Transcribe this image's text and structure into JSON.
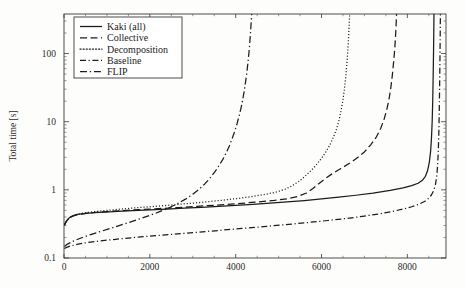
{
  "chart_data": {
    "type": "line",
    "title": "",
    "xlabel": "",
    "ylabel": "Total time [s]",
    "xlim": [
      0,
      8900
    ],
    "ylim": [
      0.1,
      380
    ],
    "yscale": "log",
    "xscale": "linear",
    "grid": false,
    "legend_position": "top-left",
    "xticks": [
      0,
      2000,
      4000,
      6000,
      8000
    ],
    "xtick_labels": [
      "0",
      "2000",
      "4000",
      "6000",
      "8000"
    ],
    "yticks": [
      0.1,
      1,
      10,
      100
    ],
    "ytick_labels": [
      "0.1",
      "1",
      "10",
      "100"
    ],
    "series": [
      {
        "name": "Kaki (all)",
        "dash": "none",
        "points": [
          [
            10,
            0.3
          ],
          [
            25,
            0.315
          ],
          [
            45,
            0.335
          ],
          [
            70,
            0.355
          ],
          [
            100,
            0.375
          ],
          [
            140,
            0.395
          ],
          [
            190,
            0.412
          ],
          [
            250,
            0.425
          ],
          [
            320,
            0.435
          ],
          [
            400,
            0.443
          ],
          [
            520,
            0.452
          ],
          [
            700,
            0.462
          ],
          [
            950,
            0.472
          ],
          [
            1250,
            0.483
          ],
          [
            1600,
            0.495
          ],
          [
            2000,
            0.508
          ],
          [
            2400,
            0.522
          ],
          [
            2800,
            0.537
          ],
          [
            3200,
            0.553
          ],
          [
            3600,
            0.57
          ],
          [
            4000,
            0.59
          ],
          [
            4400,
            0.612
          ],
          [
            4800,
            0.637
          ],
          [
            5200,
            0.665
          ],
          [
            5600,
            0.697
          ],
          [
            6000,
            0.735
          ],
          [
            6400,
            0.78
          ],
          [
            6800,
            0.833
          ],
          [
            7200,
            0.898
          ],
          [
            7600,
            0.985
          ],
          [
            7900,
            1.07
          ],
          [
            8100,
            1.15
          ],
          [
            8250,
            1.25
          ],
          [
            8350,
            1.38
          ],
          [
            8420,
            1.58
          ],
          [
            8470,
            1.9
          ],
          [
            8510,
            2.5
          ],
          [
            8540,
            3.6
          ],
          [
            8560,
            5.5
          ],
          [
            8578,
            10
          ],
          [
            8592,
            22
          ],
          [
            8602,
            50
          ],
          [
            8610,
            110
          ],
          [
            8616,
            230
          ],
          [
            8620,
            380
          ]
        ]
      },
      {
        "name": "Collective",
        "dash": "dashed",
        "points": [
          [
            10,
            0.305
          ],
          [
            30,
            0.325
          ],
          [
            60,
            0.348
          ],
          [
            100,
            0.372
          ],
          [
            150,
            0.395
          ],
          [
            220,
            0.415
          ],
          [
            300,
            0.43
          ],
          [
            400,
            0.442
          ],
          [
            550,
            0.455
          ],
          [
            750,
            0.468
          ],
          [
            1000,
            0.48
          ],
          [
            1350,
            0.495
          ],
          [
            1750,
            0.512
          ],
          [
            2200,
            0.53
          ],
          [
            2650,
            0.55
          ],
          [
            3100,
            0.572
          ],
          [
            3550,
            0.597
          ],
          [
            4000,
            0.625
          ],
          [
            4450,
            0.658
          ],
          [
            4900,
            0.7
          ],
          [
            5200,
            0.74
          ],
          [
            5450,
            0.8
          ],
          [
            5650,
            0.9
          ],
          [
            5800,
            1.05
          ],
          [
            5950,
            1.25
          ],
          [
            6100,
            1.48
          ],
          [
            6250,
            1.72
          ],
          [
            6450,
            2.05
          ],
          [
            6650,
            2.45
          ],
          [
            6850,
            3.0
          ],
          [
            7000,
            3.6
          ],
          [
            7150,
            4.6
          ],
          [
            7280,
            6.0
          ],
          [
            7380,
            8.0
          ],
          [
            7460,
            11
          ],
          [
            7520,
            15
          ],
          [
            7570,
            21
          ],
          [
            7610,
            30
          ],
          [
            7645,
            45
          ],
          [
            7675,
            70
          ],
          [
            7700,
            105
          ],
          [
            7720,
            160
          ],
          [
            7735,
            240
          ],
          [
            7748,
            380
          ]
        ]
      },
      {
        "name": "Decomposition",
        "dash": "dotted",
        "points": [
          [
            10,
            0.31
          ],
          [
            30,
            0.33
          ],
          [
            60,
            0.352
          ],
          [
            100,
            0.375
          ],
          [
            150,
            0.398
          ],
          [
            220,
            0.42
          ],
          [
            310,
            0.438
          ],
          [
            420,
            0.452
          ],
          [
            570,
            0.468
          ],
          [
            760,
            0.483
          ],
          [
            1000,
            0.5
          ],
          [
            1300,
            0.52
          ],
          [
            1650,
            0.543
          ],
          [
            2050,
            0.568
          ],
          [
            2450,
            0.595
          ],
          [
            2850,
            0.625
          ],
          [
            3250,
            0.66
          ],
          [
            3650,
            0.7
          ],
          [
            4050,
            0.748
          ],
          [
            4400,
            0.8
          ],
          [
            4700,
            0.86
          ],
          [
            4950,
            0.93
          ],
          [
            5150,
            1.02
          ],
          [
            5320,
            1.15
          ],
          [
            5470,
            1.33
          ],
          [
            5600,
            1.55
          ],
          [
            5730,
            1.85
          ],
          [
            5860,
            2.25
          ],
          [
            5980,
            2.8
          ],
          [
            6090,
            3.5
          ],
          [
            6190,
            4.5
          ],
          [
            6270,
            5.8
          ],
          [
            6340,
            7.5
          ],
          [
            6400,
            10.0
          ],
          [
            6450,
            14
          ],
          [
            6495,
            20
          ],
          [
            6530,
            29
          ],
          [
            6562,
            44
          ],
          [
            6590,
            70
          ],
          [
            6612,
            110
          ],
          [
            6630,
            175
          ],
          [
            6645,
            270
          ],
          [
            6656,
            380
          ]
        ]
      },
      {
        "name": "Baseline",
        "dash": "dashdot",
        "points": [
          [
            10,
            0.138
          ],
          [
            60,
            0.143
          ],
          [
            150,
            0.15
          ],
          [
            300,
            0.158
          ],
          [
            500,
            0.167
          ],
          [
            800,
            0.177
          ],
          [
            1200,
            0.188
          ],
          [
            1650,
            0.2
          ],
          [
            2150,
            0.213
          ],
          [
            2650,
            0.226
          ],
          [
            3150,
            0.24
          ],
          [
            3650,
            0.255
          ],
          [
            4150,
            0.271
          ],
          [
            4650,
            0.289
          ],
          [
            5150,
            0.308
          ],
          [
            5650,
            0.33
          ],
          [
            6150,
            0.355
          ],
          [
            6600,
            0.382
          ],
          [
            7000,
            0.412
          ],
          [
            7350,
            0.445
          ],
          [
            7650,
            0.482
          ],
          [
            7900,
            0.522
          ],
          [
            8100,
            0.565
          ],
          [
            8270,
            0.615
          ],
          [
            8400,
            0.675
          ],
          [
            8490,
            0.745
          ],
          [
            8560,
            0.84
          ],
          [
            8615,
            0.98
          ],
          [
            8655,
            1.2
          ],
          [
            8685,
            1.6
          ],
          [
            8705,
            2.3
          ],
          [
            8720,
            3.6
          ],
          [
            8732,
            6.5
          ],
          [
            8742,
            13
          ],
          [
            8750,
            28
          ],
          [
            8757,
            62
          ],
          [
            8763,
            140
          ],
          [
            8768,
            290
          ],
          [
            8771,
            380
          ]
        ]
      },
      {
        "name": "FLIP",
        "dash": "dashdot2",
        "points": [
          [
            10,
            0.148
          ],
          [
            80,
            0.16
          ],
          [
            200,
            0.175
          ],
          [
            380,
            0.195
          ],
          [
            600,
            0.218
          ],
          [
            850,
            0.245
          ],
          [
            1120,
            0.277
          ],
          [
            1400,
            0.315
          ],
          [
            1680,
            0.36
          ],
          [
            1950,
            0.412
          ],
          [
            2200,
            0.47
          ],
          [
            2430,
            0.54
          ],
          [
            2640,
            0.625
          ],
          [
            2830,
            0.73
          ],
          [
            3000,
            0.86
          ],
          [
            3150,
            1.02
          ],
          [
            3280,
            1.22
          ],
          [
            3400,
            1.48
          ],
          [
            3510,
            1.82
          ],
          [
            3610,
            2.25
          ],
          [
            3700,
            2.8
          ],
          [
            3780,
            3.5
          ],
          [
            3855,
            4.45
          ],
          [
            3920,
            5.7
          ],
          [
            3980,
            7.3
          ],
          [
            4035,
            9.5
          ],
          [
            4085,
            12.5
          ],
          [
            4130,
            16.5
          ],
          [
            4170,
            22
          ],
          [
            4205,
            30
          ],
          [
            4237,
            41
          ],
          [
            4265,
            56
          ],
          [
            4290,
            78
          ],
          [
            4312,
            108
          ],
          [
            4330,
            150
          ],
          [
            4346,
            205
          ],
          [
            4360,
            280
          ],
          [
            4372,
            380
          ]
        ]
      }
    ]
  },
  "axes": {
    "ylabel": "Total time [s]"
  },
  "legend": {
    "items": [
      {
        "label": "Kaki (all)"
      },
      {
        "label": "Collective"
      },
      {
        "label": "Decomposition"
      },
      {
        "label": "Baseline"
      },
      {
        "label": "FLIP"
      }
    ]
  }
}
